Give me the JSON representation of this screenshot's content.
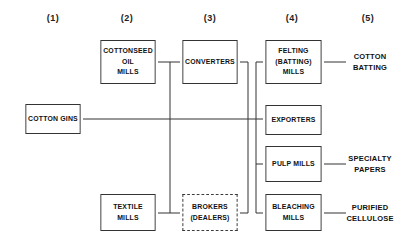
{
  "diagram": {
    "columns": [
      {
        "label": "(1)"
      },
      {
        "label": "(2)"
      },
      {
        "label": "(3)"
      },
      {
        "label": "(4)"
      },
      {
        "label": "(5)"
      }
    ],
    "nodes": {
      "cotton_gins": "COTTON GINS",
      "cottonseed_oil_mills": "COTTONSEED\nOIL\nMILLS",
      "textile_mills": "TEXTILE\nMILLS",
      "converters": "CONVERTERS",
      "brokers_dealers": "BROKERS\n(DEALERS)",
      "felting_batting_mills": "FELTING\n(BATTING)\nMILLS",
      "exporters": "EXPORTERS",
      "pulp_mills": "PULP MILLS",
      "bleaching_mills": "BLEACHING\nMILLS"
    },
    "outputs": {
      "cotton_batting": "COTTON\nBATTING",
      "specialty_papers": "SPECIALTY\nPAPERS",
      "purified_cellulose": "PURIFIED\nCELLULOSE"
    },
    "edges": [
      {
        "from": "Cottonseed Oil Mills",
        "to": "Converters"
      },
      {
        "from": "Cottonseed Oil Mills",
        "to": "Brokers (Dealers)"
      },
      {
        "from": "Textile Mills",
        "to": "Brokers (Dealers)"
      },
      {
        "from": "Textile Mills",
        "to": "Converters"
      },
      {
        "from": "Cotton Gins",
        "to": "Exporters"
      },
      {
        "from": "Converters",
        "to": "Felting (Batting) Mills"
      },
      {
        "from": "Converters",
        "to": "Exporters"
      },
      {
        "from": "Converters",
        "to": "Pulp Mills"
      },
      {
        "from": "Converters",
        "to": "Bleaching Mills"
      },
      {
        "from": "Brokers (Dealers)",
        "to": "Felting (Batting) Mills"
      },
      {
        "from": "Brokers (Dealers)",
        "to": "Exporters"
      },
      {
        "from": "Brokers (Dealers)",
        "to": "Pulp Mills"
      },
      {
        "from": "Brokers (Dealers)",
        "to": "Bleaching Mills"
      },
      {
        "from": "Felting (Batting) Mills",
        "to": "Cotton Batting"
      },
      {
        "from": "Pulp Mills",
        "to": "Specialty Papers"
      },
      {
        "from": "Bleaching Mills",
        "to": "Purified Cellulose"
      }
    ],
    "colors": {
      "line": "#333333",
      "text": "#111111",
      "background": "#ffffff"
    }
  }
}
